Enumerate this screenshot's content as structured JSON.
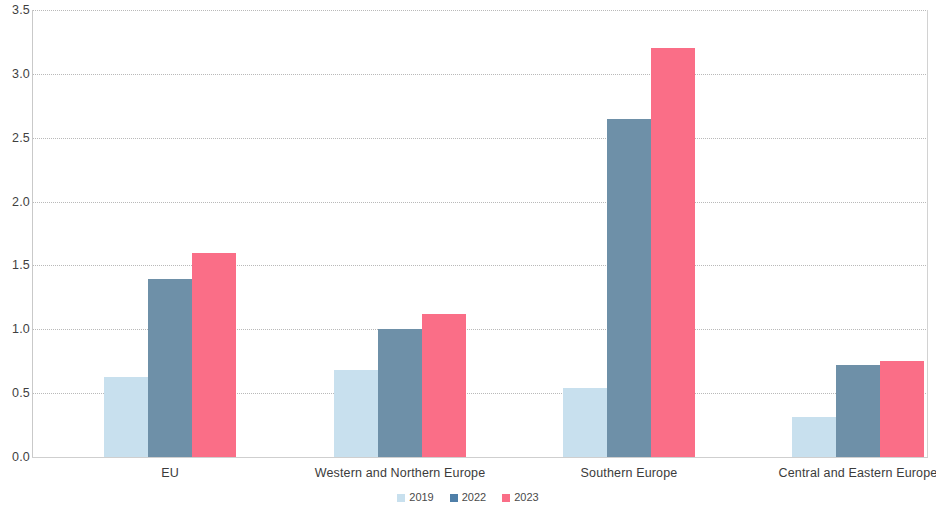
{
  "chart_data": {
    "type": "bar",
    "title": "",
    "subtitle": "",
    "xlabel": "",
    "ylabel": "",
    "ylim": [
      0.0,
      3.5
    ],
    "yticks": [
      "0.0",
      "0.5",
      "1.0",
      "1.5",
      "2.0",
      "2.5",
      "3.0",
      "3.5"
    ],
    "ytick_values": [
      0.0,
      0.5,
      1.0,
      1.5,
      2.0,
      2.5,
      3.0,
      3.5
    ],
    "grid": true,
    "grid_axis": "y",
    "legend_position": "bottom-center",
    "categories": [
      "EU",
      "Western and Northern Europe",
      "Southern Europe",
      "Central and Eastern Europe"
    ],
    "series": [
      {
        "name": "2019",
        "color": "#c8e0ee",
        "values": [
          0.63,
          0.68,
          0.54,
          0.31
        ]
      },
      {
        "name": "2022",
        "color": "#6e90a8",
        "values": [
          1.39,
          1.0,
          2.65,
          0.72
        ]
      },
      {
        "name": "2023",
        "color": "#fa6e87",
        "values": [
          1.6,
          1.12,
          3.2,
          0.755
        ]
      }
    ]
  },
  "legend": {
    "items": [
      {
        "label": "2019",
        "swatch_color": "#c8e0ee"
      },
      {
        "label": "2022",
        "swatch_color": "#4f7fa8"
      },
      {
        "label": "2023",
        "swatch_color": "#fa6e87"
      }
    ]
  },
  "axes": {
    "y_tick_labels": [
      "3.5",
      "3.0",
      "2.5",
      "2.0",
      "1.5",
      "1.0",
      "0.5",
      "0.0"
    ],
    "x_tick_labels": [
      "EU",
      "Western and Northern Europe",
      "Southern Europe",
      "Central and Eastern Europe"
    ]
  }
}
